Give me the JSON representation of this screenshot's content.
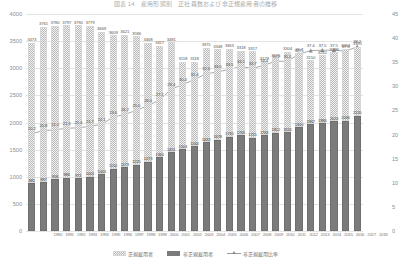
{
  "chart": {
    "title": "図表 14　雇用形態別　正社員数および非正規雇用者の推移",
    "y_left_label": "",
    "y_right_label": ""
  },
  "legend": {
    "items": [
      {
        "name": "series-regular",
        "label": "正規雇用者"
      },
      {
        "name": "series-nonregular",
        "label": "非正規雇用者"
      },
      {
        "name": "series-rate",
        "label": "非正規雇用比率"
      }
    ]
  },
  "chart_data": {
    "type": "bar",
    "title": "図表 14　雇用形態別　正社員数および非正規雇用者の推移",
    "xlabel": "",
    "ylabel": "",
    "ylim": [
      0,
      4000
    ],
    "y2lim": [
      0,
      45
    ],
    "yticks": [
      0,
      500,
      1000,
      1500,
      2000,
      2500,
      3000,
      3500,
      4000
    ],
    "y2ticks": [
      0,
      5,
      10,
      15,
      20,
      25,
      30,
      35,
      40,
      45
    ],
    "grid": true,
    "legend_position": "bottom",
    "stacked": true,
    "categories": [
      "1990",
      "1991",
      "1992",
      "1993",
      "1994",
      "1995",
      "1996",
      "1997",
      "1998",
      "1999",
      "2000",
      "2001",
      "2002",
      "2003",
      "2004",
      "2005",
      "2006",
      "2007",
      "2008",
      "2009",
      "2010",
      "2011",
      "2012",
      "2013",
      "2014",
      "2015",
      "2016",
      "2017",
      "2018"
    ],
    "series": [
      {
        "name": "正規雇用者",
        "type": "bar",
        "axis": "left",
        "values": [
          3473,
          3761,
          3780,
          3797,
          3790,
          3779,
          3669,
          3609,
          3621,
          3586,
          3468,
          3417,
          3481,
          3118,
          3118,
          3375,
          3348,
          3363,
          3318,
          3317,
          3129,
          3185,
          3304,
          3275,
          3150,
          3242,
          3298,
          3364,
          3395
        ]
      },
      {
        "name": "非正規雇用者",
        "type": "bar",
        "axis": "left",
        "values": [
          881,
          897,
          958,
          986,
          971,
          1001,
          1043,
          1152,
          1173,
          1225,
          1273,
          1360,
          1451,
          1504,
          1564,
          1633,
          1678,
          1735,
          1765,
          1721,
          1763,
          1812,
          1816,
          1910,
          1967,
          1986,
          2023,
          2036,
          2120
        ]
      },
      {
        "name": "非正規雇用比率",
        "type": "line",
        "axis": "right",
        "values": [
          20.2,
          20.8,
          21.0,
          21.3,
          21.4,
          21.7,
          22.1,
          23.6,
          24.2,
          25.0,
          26.0,
          27.2,
          29.4,
          30.4,
          31.4,
          32.6,
          33.0,
          33.5,
          34.1,
          33.7,
          34.4,
          35.2,
          35.2,
          36.7,
          37.4,
          37.5,
          37.5,
          37.3,
          38.2
        ]
      }
    ],
    "value_labels_top": [
      "3473",
      "3761",
      "3780",
      "3797",
      "3790",
      "3669",
      "3609",
      "3621",
      "3468",
      "3417",
      "3481",
      "3118",
      "3118",
      "3375",
      "3348",
      "3363",
      "3318",
      "3317",
      "3129",
      "3185",
      "3304",
      "3275",
      "3150",
      "3242",
      "3298",
      "3364",
      "3395"
    ],
    "rate_labels_shown": [
      "20.2",
      "20.8",
      "21.4",
      "22.1",
      "23.6",
      "24.2",
      "25.0",
      "26.0",
      "27.2",
      "29.4",
      "30.4",
      "31.4",
      "32.6",
      "33.0",
      "33.5",
      "34.1",
      "33.7",
      "34.4",
      "35.2",
      "36.7",
      "37.4",
      "37.5",
      "38.2"
    ]
  }
}
